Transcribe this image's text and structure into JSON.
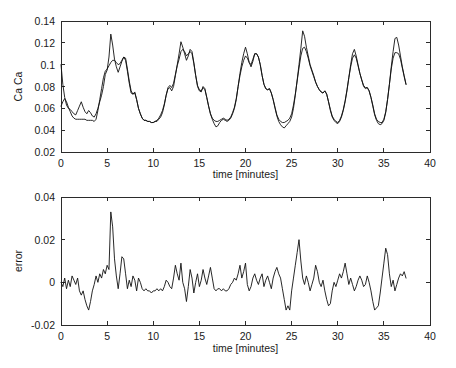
{
  "figure": {
    "background_color": "#ffffff",
    "line_color": "#111111",
    "axis_color": "#2b2b2b"
  },
  "chart_data": [
    {
      "type": "line",
      "title": "",
      "subtitle": "",
      "xlabel": "time [minutes]",
      "ylabel": "Ca  Ca",
      "xlim": [
        0,
        40
      ],
      "ylim": [
        0.02,
        0.14
      ],
      "xticks": [
        0,
        5,
        10,
        15,
        20,
        25,
        30,
        35,
        40
      ],
      "xticklabels": [
        "0",
        "5",
        "10",
        "15",
        "20",
        "25",
        "30",
        "35",
        "40"
      ],
      "yticks": [
        0.02,
        0.04,
        0.06,
        0.08,
        0.1,
        0.12,
        0.14
      ],
      "yticklabels": [
        "0.02",
        "0.04",
        "0.06",
        "0.08",
        "0.1",
        "0.12",
        "0.14"
      ],
      "grid": false,
      "legend": null,
      "legend_position": "none",
      "x": [
        0,
        0.2,
        0.4,
        0.6,
        0.8,
        1.0,
        1.2,
        1.4,
        1.6,
        1.8,
        2.0,
        2.2,
        2.4,
        2.6,
        2.8,
        3.0,
        3.2,
        3.4,
        3.6,
        3.8,
        4.0,
        4.2,
        4.4,
        4.6,
        4.8,
        5.0,
        5.2,
        5.4,
        5.6,
        5.8,
        6.0,
        6.2,
        6.4,
        6.6,
        6.8,
        7.0,
        7.2,
        7.4,
        7.6,
        7.8,
        8.0,
        8.2,
        8.4,
        8.6,
        8.8,
        9.0,
        9.2,
        9.4,
        9.6,
        9.8,
        10.0,
        10.2,
        10.4,
        10.6,
        10.8,
        11.0,
        11.2,
        11.4,
        11.6,
        11.8,
        12.0,
        12.2,
        12.4,
        12.6,
        12.8,
        13.0,
        13.2,
        13.4,
        13.6,
        13.8,
        14.0,
        14.2,
        14.4,
        14.6,
        14.8,
        15.0,
        15.2,
        15.4,
        15.6,
        15.8,
        16.0,
        16.2,
        16.4,
        16.6,
        16.8,
        17.0,
        17.2,
        17.4,
        17.6,
        17.8,
        18.0,
        18.2,
        18.4,
        18.6,
        18.8,
        19.0,
        19.2,
        19.4,
        19.6,
        19.8,
        20.0,
        20.2,
        20.4,
        20.6,
        20.8,
        21.0,
        21.2,
        21.4,
        21.6,
        21.8,
        22.0,
        22.2,
        22.4,
        22.6,
        22.8,
        23.0,
        23.2,
        23.4,
        23.6,
        23.8,
        24.0,
        24.2,
        24.4,
        24.6,
        24.8,
        25.0,
        25.2,
        25.4,
        25.6,
        25.8,
        26.0,
        26.2,
        26.4,
        26.6,
        26.8,
        27.0,
        27.2,
        27.4,
        27.6,
        27.8,
        28.0,
        28.2,
        28.4,
        28.6,
        28.8,
        29.0,
        29.2,
        29.4,
        29.6,
        29.8,
        30.0,
        30.2,
        30.4,
        30.6,
        30.8,
        31.0,
        31.2,
        31.4,
        31.6,
        31.8,
        32.0,
        32.2,
        32.4,
        32.6,
        32.8,
        33.0,
        33.2,
        33.4,
        33.6,
        33.8,
        34.0,
        34.2,
        34.4,
        34.6,
        34.8,
        35.0,
        35.2,
        35.4,
        35.6,
        35.8,
        36.0,
        36.2,
        36.4,
        36.6,
        36.8,
        37.0,
        37.2,
        37.4
      ],
      "series": [
        {
          "name": "measured",
          "values": [
            0.1,
            0.082,
            0.07,
            0.063,
            0.06,
            0.059,
            0.057,
            0.055,
            0.054,
            0.058,
            0.062,
            0.066,
            0.061,
            0.057,
            0.055,
            0.058,
            0.056,
            0.053,
            0.052,
            0.055,
            0.06,
            0.066,
            0.072,
            0.08,
            0.091,
            0.095,
            0.107,
            0.128,
            0.118,
            0.105,
            0.098,
            0.093,
            0.098,
            0.103,
            0.107,
            0.104,
            0.094,
            0.083,
            0.074,
            0.073,
            0.075,
            0.068,
            0.06,
            0.055,
            0.051,
            0.049,
            0.049,
            0.048,
            0.048,
            0.047,
            0.047,
            0.048,
            0.048,
            0.05,
            0.052,
            0.056,
            0.063,
            0.072,
            0.078,
            0.079,
            0.076,
            0.08,
            0.09,
            0.1,
            0.11,
            0.121,
            0.116,
            0.11,
            0.104,
            0.108,
            0.114,
            0.112,
            0.102,
            0.09,
            0.08,
            0.076,
            0.075,
            0.08,
            0.078,
            0.07,
            0.062,
            0.055,
            0.05,
            0.046,
            0.043,
            0.044,
            0.047,
            0.049,
            0.05,
            0.049,
            0.048,
            0.049,
            0.051,
            0.055,
            0.06,
            0.068,
            0.08,
            0.092,
            0.102,
            0.11,
            0.116,
            0.11,
            0.102,
            0.098,
            0.103,
            0.11,
            0.11,
            0.107,
            0.1,
            0.09,
            0.082,
            0.078,
            0.077,
            0.078,
            0.074,
            0.068,
            0.06,
            0.053,
            0.048,
            0.045,
            0.043,
            0.042,
            0.044,
            0.046,
            0.048,
            0.052,
            0.06,
            0.072,
            0.086,
            0.1,
            0.115,
            0.131,
            0.126,
            0.116,
            0.108,
            0.1,
            0.095,
            0.09,
            0.084,
            0.08,
            0.077,
            0.075,
            0.074,
            0.076,
            0.073,
            0.066,
            0.058,
            0.052,
            0.049,
            0.047,
            0.046,
            0.048,
            0.052,
            0.058,
            0.066,
            0.076,
            0.088,
            0.1,
            0.11,
            0.114,
            0.108,
            0.1,
            0.092,
            0.086,
            0.08,
            0.078,
            0.079,
            0.076,
            0.07,
            0.062,
            0.054,
            0.049,
            0.046,
            0.045,
            0.046,
            0.049,
            0.056,
            0.068,
            0.082,
            0.098,
            0.112,
            0.124,
            0.125,
            0.118,
            0.108,
            0.098,
            0.09,
            0.082,
            0.078,
            0.077,
            0.078,
            0.074,
            0.066,
            0.057,
            0.05,
            0.05
          ]
        },
        {
          "name": "model",
          "values": [
            0.062,
            0.066,
            0.069,
            0.066,
            0.061,
            0.057,
            0.053,
            0.051,
            0.05,
            0.05,
            0.05,
            0.05,
            0.05,
            0.05,
            0.049,
            0.049,
            0.049,
            0.049,
            0.048,
            0.05,
            0.058,
            0.068,
            0.078,
            0.088,
            0.094,
            0.096,
            0.099,
            0.102,
            0.104,
            0.104,
            0.102,
            0.1,
            0.101,
            0.104,
            0.107,
            0.106,
            0.096,
            0.085,
            0.076,
            0.073,
            0.074,
            0.068,
            0.06,
            0.055,
            0.051,
            0.049,
            0.049,
            0.048,
            0.048,
            0.047,
            0.047,
            0.048,
            0.049,
            0.051,
            0.054,
            0.058,
            0.064,
            0.072,
            0.079,
            0.081,
            0.079,
            0.083,
            0.091,
            0.099,
            0.105,
            0.112,
            0.114,
            0.112,
            0.108,
            0.11,
            0.112,
            0.11,
            0.101,
            0.09,
            0.081,
            0.077,
            0.076,
            0.079,
            0.077,
            0.07,
            0.062,
            0.055,
            0.051,
            0.049,
            0.048,
            0.048,
            0.049,
            0.05,
            0.051,
            0.05,
            0.049,
            0.05,
            0.052,
            0.056,
            0.061,
            0.069,
            0.08,
            0.09,
            0.098,
            0.104,
            0.108,
            0.106,
            0.102,
            0.1,
            0.105,
            0.11,
            0.11,
            0.107,
            0.1,
            0.09,
            0.082,
            0.078,
            0.077,
            0.078,
            0.074,
            0.068,
            0.061,
            0.054,
            0.05,
            0.048,
            0.047,
            0.047,
            0.048,
            0.049,
            0.051,
            0.055,
            0.063,
            0.073,
            0.085,
            0.097,
            0.108,
            0.115,
            0.116,
            0.112,
            0.106,
            0.099,
            0.094,
            0.089,
            0.084,
            0.08,
            0.077,
            0.075,
            0.074,
            0.076,
            0.073,
            0.066,
            0.059,
            0.053,
            0.05,
            0.048,
            0.047,
            0.049,
            0.053,
            0.059,
            0.067,
            0.077,
            0.088,
            0.098,
            0.106,
            0.109,
            0.106,
            0.099,
            0.092,
            0.086,
            0.081,
            0.079,
            0.079,
            0.076,
            0.07,
            0.063,
            0.055,
            0.05,
            0.048,
            0.047,
            0.047,
            0.05,
            0.057,
            0.068,
            0.082,
            0.096,
            0.106,
            0.111,
            0.111,
            0.11,
            0.105,
            0.097,
            0.089,
            0.082,
            0.079,
            0.078,
            0.078,
            0.074,
            0.067,
            0.059,
            0.052,
            0.05
          ]
        }
      ]
    },
    {
      "type": "line",
      "title": "",
      "subtitle": "",
      "xlabel": "time [minutes]",
      "ylabel": "error",
      "xlim": [
        0,
        40
      ],
      "ylim": [
        -0.02,
        0.04
      ],
      "xticks": [
        0,
        5,
        10,
        15,
        20,
        25,
        30,
        35,
        40
      ],
      "xticklabels": [
        "0",
        "5",
        "10",
        "15",
        "20",
        "25",
        "30",
        "35",
        "40"
      ],
      "yticks": [
        -0.02,
        0,
        0.02,
        0.04
      ],
      "yticklabels": [
        "-0.02",
        "0",
        "0.02",
        "0.04"
      ],
      "grid": false,
      "legend": null,
      "legend_position": "none",
      "x": [
        0,
        0.2,
        0.4,
        0.6,
        0.8,
        1.0,
        1.2,
        1.4,
        1.6,
        1.8,
        2.0,
        2.2,
        2.4,
        2.6,
        2.8,
        3.0,
        3.2,
        3.4,
        3.6,
        3.8,
        4.0,
        4.2,
        4.4,
        4.6,
        4.8,
        5.0,
        5.2,
        5.4,
        5.6,
        5.8,
        6.0,
        6.2,
        6.4,
        6.6,
        6.8,
        7.0,
        7.2,
        7.4,
        7.6,
        7.8,
        8.0,
        8.2,
        8.4,
        8.6,
        8.8,
        9.0,
        9.2,
        9.4,
        9.6,
        9.8,
        10.0,
        10.2,
        10.4,
        10.6,
        10.8,
        11.0,
        11.2,
        11.4,
        11.6,
        11.8,
        12.0,
        12.2,
        12.4,
        12.6,
        12.8,
        13.0,
        13.2,
        13.4,
        13.6,
        13.8,
        14.0,
        14.2,
        14.4,
        14.6,
        14.8,
        15.0,
        15.2,
        15.4,
        15.6,
        15.8,
        16.0,
        16.2,
        16.4,
        16.6,
        16.8,
        17.0,
        17.2,
        17.4,
        17.6,
        17.8,
        18.0,
        18.2,
        18.4,
        18.6,
        18.8,
        19.0,
        19.2,
        19.4,
        19.6,
        19.8,
        20.0,
        20.2,
        20.4,
        20.6,
        20.8,
        21.0,
        21.2,
        21.4,
        21.6,
        21.8,
        22.0,
        22.2,
        22.4,
        22.6,
        22.8,
        23.0,
        23.2,
        23.4,
        23.6,
        23.8,
        24.0,
        24.2,
        24.4,
        24.6,
        24.8,
        25.0,
        25.2,
        25.4,
        25.6,
        25.8,
        26.0,
        26.2,
        26.4,
        26.6,
        26.8,
        27.0,
        27.2,
        27.4,
        27.6,
        27.8,
        28.0,
        28.2,
        28.4,
        28.6,
        28.8,
        29.0,
        29.2,
        29.4,
        29.6,
        29.8,
        30.0,
        30.2,
        30.4,
        30.6,
        30.8,
        31.0,
        31.2,
        31.4,
        31.6,
        31.8,
        32.0,
        32.2,
        32.4,
        32.6,
        32.8,
        33.0,
        33.2,
        33.4,
        33.6,
        33.8,
        34.0,
        34.2,
        34.4,
        34.6,
        34.8,
        35.0,
        35.2,
        35.4,
        35.6,
        35.8,
        36.0,
        36.2,
        36.4,
        36.6,
        36.8,
        37.0,
        37.2,
        37.4
      ],
      "series": [
        {
          "name": "error",
          "values": [
            0.0,
            -0.002,
            0.002,
            -0.003,
            0.001,
            -0.002,
            0.003,
            0.001,
            -0.001,
            0.002,
            -0.004,
            -0.006,
            -0.004,
            -0.008,
            -0.011,
            -0.013,
            -0.009,
            -0.004,
            -0.001,
            0.003,
            0.0,
            0.004,
            0.002,
            0.006,
            0.004,
            0.008,
            0.006,
            0.033,
            0.026,
            0.011,
            0.003,
            -0.003,
            0.004,
            0.012,
            0.011,
            0.004,
            -0.003,
            0.001,
            -0.002,
            0.003,
            0.001,
            -0.004,
            0.002,
            0.0,
            -0.003,
            -0.004,
            -0.003,
            -0.004,
            -0.004,
            -0.005,
            -0.004,
            -0.004,
            -0.003,
            -0.004,
            -0.003,
            -0.004,
            -0.002,
            0.001,
            0.0,
            -0.002,
            -0.003,
            0.002,
            0.008,
            0.004,
            0.001,
            0.009,
            0.0,
            -0.003,
            -0.009,
            -0.002,
            0.006,
            0.002,
            -0.005,
            0.0,
            0.004,
            -0.002,
            0.001,
            0.006,
            0.002,
            -0.001,
            0.003,
            0.007,
            0.002,
            -0.003,
            -0.004,
            -0.003,
            -0.003,
            -0.004,
            -0.003,
            -0.004,
            -0.004,
            -0.003,
            -0.001,
            0.0,
            0.002,
            0.001,
            0.004,
            0.008,
            0.002,
            0.005,
            0.009,
            -0.001,
            -0.004,
            -0.002,
            0.002,
            0.004,
            0.001,
            -0.001,
            0.002,
            0.004,
            -0.002,
            0.001,
            0.003,
            0.0,
            -0.003,
            0.002,
            0.005,
            0.007,
            0.004,
            0.002,
            -0.003,
            -0.008,
            -0.013,
            -0.011,
            -0.013,
            -0.004,
            0.002,
            0.008,
            0.014,
            0.02,
            0.01,
            0.002,
            -0.001,
            0.003,
            0.0,
            -0.004,
            -0.001,
            0.002,
            0.008,
            0.005,
            0.0,
            -0.002,
            0.001,
            -0.004,
            -0.008,
            -0.011,
            -0.01,
            -0.004,
            0.0,
            -0.002,
            0.001,
            0.004,
            0.002,
            0.005,
            0.009,
            0.004,
            -0.001,
            0.002,
            -0.001,
            -0.004,
            -0.002,
            0.001,
            0.003,
            0.001,
            -0.002,
            -0.001,
            0.003,
            0.0,
            -0.004,
            -0.009,
            -0.013,
            -0.012,
            -0.011,
            -0.005,
            0.002,
            0.009,
            0.016,
            0.013,
            0.004,
            -0.002,
            0.001,
            -0.004,
            -0.001,
            0.002,
            0.004,
            0.003,
            0.005,
            0.002,
            -0.001
          ]
        }
      ]
    }
  ]
}
